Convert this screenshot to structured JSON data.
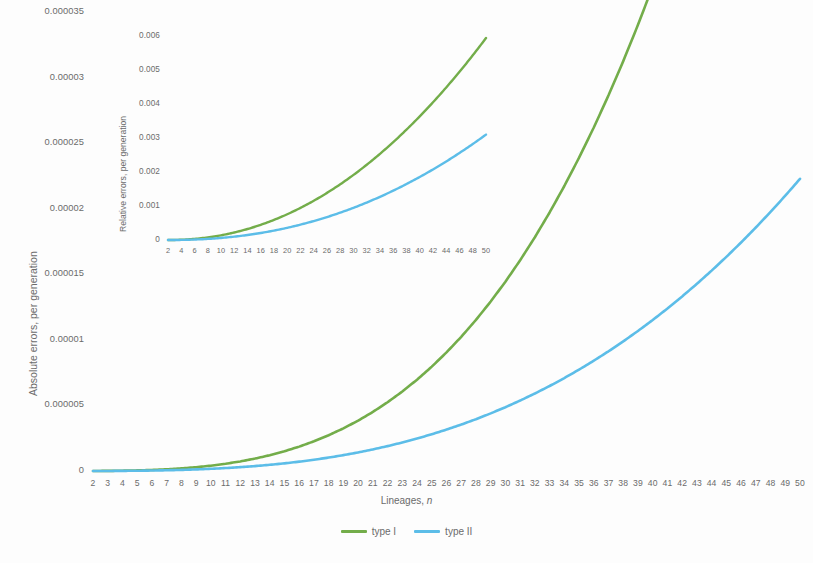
{
  "chart_data": [
    {
      "id": "main",
      "type": "line",
      "title": "",
      "xlabel": "Lineages, n",
      "ylabel": "Absolute errors, per generation",
      "xlim": [
        2,
        50
      ],
      "ylim": [
        0,
        3.5e-05
      ],
      "grid": false,
      "legend_position": "bottom",
      "x_ticks": [
        2,
        3,
        4,
        5,
        6,
        7,
        8,
        9,
        10,
        11,
        12,
        13,
        14,
        15,
        16,
        17,
        18,
        19,
        20,
        21,
        22,
        23,
        24,
        25,
        26,
        27,
        28,
        29,
        30,
        31,
        32,
        33,
        34,
        35,
        36,
        37,
        38,
        39,
        40,
        41,
        42,
        43,
        44,
        45,
        46,
        47,
        48,
        49,
        50
      ],
      "y_ticks": [
        "0",
        "0.000005",
        "0.00001",
        "0.000015",
        "0.00002",
        "0.000025",
        "0.00003",
        "0.000035"
      ],
      "y_tick_values": [
        0,
        5e-06,
        1e-05,
        1.5e-05,
        2e-05,
        2.5e-05,
        3e-05,
        3.5e-05
      ],
      "series": [
        {
          "name": "type I",
          "color": "#73AD4A",
          "x": [
            2,
            3,
            4,
            5,
            6,
            7,
            8,
            9,
            10,
            11,
            12,
            13,
            14,
            15,
            16,
            17,
            18,
            19,
            20,
            21,
            22,
            23,
            24,
            25,
            26,
            27,
            28,
            29,
            30,
            31,
            32,
            33,
            34,
            35,
            36,
            37,
            38,
            39,
            40,
            41,
            42,
            43,
            44,
            45,
            46,
            47,
            48,
            49,
            50
          ],
          "values": [
            2e-09,
            8e-09,
            2.2e-08,
            4.5e-08,
            8e-08,
            1.3e-07,
            1.99e-07,
            2.9e-07,
            4.06e-07,
            5.52e-07,
            7.31e-07,
            9.47e-07,
            1.204e-06,
            1.507e-06,
            1.859e-06,
            2.264e-06,
            2.727e-06,
            3.252e-06,
            3.843e-06,
            4.505e-06,
            5.243e-06,
            6.061e-06,
            6.964e-06,
            7.957e-06,
            9.044e-06,
            1.0231e-05,
            1.1522e-05,
            1.2922e-05,
            1.4436e-05,
            1.6069e-05,
            1.7826e-05,
            1.9712e-05,
            2.1732e-05,
            2.3891e-05,
            2.6194e-05,
            2.8647e-05,
            3.1254e-05,
            3.4021e-05,
            3.6953e-05,
            4.0056e-05,
            4.3334e-05,
            4.6793e-05,
            5.0439e-05,
            5.4277e-05,
            5.8312e-05,
            6.255e-05,
            6.6997e-05,
            7.1658e-05,
            7.6539e-05
          ]
        },
        {
          "name": "type II",
          "color": "#5CBDE8",
          "x": [
            2,
            3,
            4,
            5,
            6,
            7,
            8,
            9,
            10,
            11,
            12,
            13,
            14,
            15,
            16,
            17,
            18,
            19,
            20,
            21,
            22,
            23,
            24,
            25,
            26,
            27,
            28,
            29,
            30,
            31,
            32,
            33,
            34,
            35,
            36,
            37,
            38,
            39,
            40,
            41,
            42,
            43,
            44,
            45,
            46,
            47,
            48,
            49,
            50
          ],
          "values": [
            1e-09,
            4e-09,
            1e-08,
            2e-08,
            3.5e-08,
            5.6e-08,
            8.4e-08,
            1.21e-07,
            1.67e-07,
            2.24e-07,
            2.93e-07,
            3.75e-07,
            4.71e-07,
            5.83e-07,
            7.12e-07,
            8.58e-07,
            1.024e-06,
            1.21e-06,
            1.417e-06,
            1.646e-06,
            1.898e-06,
            2.174e-06,
            2.475e-06,
            2.802e-06,
            3.157e-06,
            3.539e-06,
            3.951e-06,
            4.393e-06,
            4.866e-06,
            5.371e-06,
            5.909e-06,
            6.481e-06,
            7.088e-06,
            7.731e-06,
            8.411e-06,
            9.128e-06,
            9.884e-06,
            1.0679e-05,
            1.1515e-05,
            1.2392e-05,
            1.3311e-05,
            1.4273e-05,
            1.5279e-05,
            1.6329e-05,
            1.7425e-05,
            1.8567e-05,
            1.9756e-05,
            2.0993e-05,
            2.2278e-05
          ]
        }
      ]
    },
    {
      "id": "inset",
      "type": "line",
      "title": "",
      "xlabel": "",
      "ylabel": "Relative errors, per generation",
      "xlim": [
        2,
        50
      ],
      "ylim": [
        0,
        0.006
      ],
      "grid": false,
      "legend_position": "none",
      "x_ticks": [
        2,
        4,
        6,
        8,
        10,
        12,
        14,
        16,
        18,
        20,
        22,
        24,
        26,
        28,
        30,
        32,
        34,
        36,
        38,
        40,
        42,
        44,
        46,
        48,
        50
      ],
      "y_ticks": [
        "0",
        "0.001",
        "0.002",
        "0.003",
        "0.004",
        "0.005",
        "0.006"
      ],
      "y_tick_values": [
        0,
        0.001,
        0.002,
        0.003,
        0.004,
        0.005,
        0.006
      ],
      "series": [
        {
          "name": "type I",
          "color": "#73AD4A",
          "x": [
            2,
            3,
            4,
            5,
            6,
            7,
            8,
            9,
            10,
            11,
            12,
            13,
            14,
            15,
            16,
            17,
            18,
            19,
            20,
            21,
            22,
            23,
            24,
            25,
            26,
            27,
            28,
            29,
            30,
            31,
            32,
            33,
            34,
            35,
            36,
            37,
            38,
            39,
            40,
            41,
            42,
            43,
            44,
            45,
            46,
            47,
            48,
            49,
            50
          ],
          "values": [
            1e-05,
            3e-05,
            7e-05,
            0.00013,
            0.00021,
            0.00032,
            0.000455,
            0.000617,
            0.000808,
            0.001028,
            0.001278,
            0.0,
            0.0,
            0.0,
            0.0,
            0.0,
            0.0,
            0.0,
            0.0,
            0.0,
            0.0,
            0.0,
            0.0,
            0.0,
            0.0,
            0.0,
            0.0,
            0.0,
            0.0,
            0.0,
            0.0,
            0.0,
            0.0,
            0.0,
            0.0,
            0.0,
            0.0,
            0.0,
            0.0,
            0.0,
            0.0,
            0.0,
            0.0,
            0.0,
            0.0,
            0.0,
            0.0,
            0.0,
            0.00594
          ]
        },
        {
          "name": "type II",
          "color": "#5CBDE8",
          "x": [
            2,
            3,
            4,
            5,
            6,
            7,
            8,
            9,
            10,
            11,
            12,
            13,
            14,
            15,
            16,
            17,
            18,
            19,
            20,
            21,
            22,
            23,
            24,
            25,
            26,
            27,
            28,
            29,
            30,
            31,
            32,
            33,
            34,
            35,
            36,
            37,
            38,
            39,
            40,
            41,
            42,
            43,
            44,
            45,
            46,
            47,
            48,
            49,
            50
          ],
          "values": [
            5e-06,
            1.5e-05,
            3e-05,
            6e-05,
            0.0001,
            0.00015,
            0.00021,
            0.00028,
            0.00036,
            0.00046,
            0.00057,
            0.0,
            0.0,
            0.0,
            0.0,
            0.0,
            0.0,
            0.0,
            0.0,
            0.0,
            0.0,
            0.0,
            0.0,
            0.0,
            0.0,
            0.0,
            0.0,
            0.0,
            0.0,
            0.0,
            0.0,
            0.0,
            0.0,
            0.0,
            0.0,
            0.0,
            0.0,
            0.0,
            0.0,
            0.0,
            0.0,
            0.0,
            0.0,
            0.0,
            0.0,
            0.0,
            0.0,
            0.0,
            0.0031
          ]
        }
      ]
    }
  ],
  "legend": {
    "items": [
      {
        "label": "type I",
        "color": "#73AD4A"
      },
      {
        "label": "type II",
        "color": "#5CBDE8"
      }
    ]
  },
  "colors": {
    "type_i": "#73AD4A",
    "type_ii": "#5CBDE8",
    "text": "#6b6b6b",
    "background": "#fdfdfd"
  },
  "main_axis": {
    "ylabel": "Absolute errors, per generation",
    "xlabel_prefix": "Lineages, ",
    "xlabel_italic": "n"
  },
  "inset_axis": {
    "ylabel": "Relative errors, per generation"
  }
}
